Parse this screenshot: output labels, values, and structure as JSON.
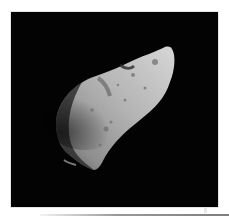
{
  "image": {
    "subject": "asteroid",
    "description": "Grayscale photograph of an irregular, elongated cratered asteroid against black space",
    "colors": {
      "background": "#ffffff",
      "frame": "#030303",
      "surface_light": "#c8c8c8",
      "surface_mid": "#8c8c8c",
      "surface_shadow": "#3a3a3a"
    }
  }
}
